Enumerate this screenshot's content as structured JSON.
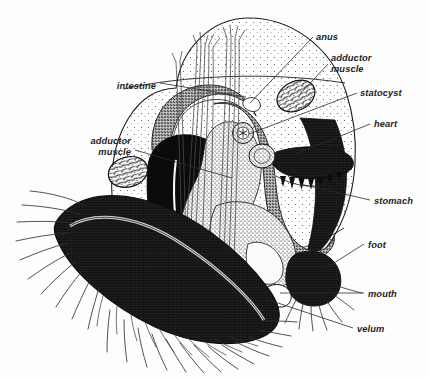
{
  "figure": {
    "organism": "veliger larva",
    "style": "black-and-white stippled scientific line drawing",
    "canvas": {
      "width": 428,
      "height": 377,
      "background": "#fdfdfd"
    },
    "ink_color": "#1d1d1d",
    "label_color": "#242424"
  },
  "labels": [
    {
      "id": "anus",
      "text": "anus",
      "side": "right",
      "x": 318,
      "y": 40,
      "anchor_x": 248,
      "anchor_y": 104
    },
    {
      "id": "adductor-right",
      "text": "adductor",
      "side": "right",
      "x": 333,
      "y": 60,
      "anchor_x": 299,
      "anchor_y": 93
    },
    {
      "id": "adductor-right-2",
      "text": "muscle",
      "side": "right",
      "x": 333,
      "y": 70,
      "anchor_x": 0,
      "anchor_y": 0
    },
    {
      "id": "statocyst",
      "text": "statocyst",
      "side": "right",
      "x": 362,
      "y": 96,
      "anchor_x": 245,
      "anchor_y": 133
    },
    {
      "id": "heart",
      "text": "heart",
      "side": "right",
      "x": 375,
      "y": 127,
      "anchor_x": 280,
      "anchor_y": 155
    },
    {
      "id": "stomach",
      "text": "stomach",
      "side": "right",
      "x": 375,
      "y": 203,
      "anchor_x": 300,
      "anchor_y": 186
    },
    {
      "id": "foot",
      "text": "foot",
      "side": "right",
      "x": 369,
      "y": 247,
      "anchor_x": 316,
      "anchor_y": 272
    },
    {
      "id": "mouth",
      "text": "mouth",
      "side": "right",
      "x": 369,
      "y": 296,
      "anchor_x": 277,
      "anchor_y": 296
    },
    {
      "id": "velum",
      "text": "velum",
      "side": "right",
      "x": 358,
      "y": 331,
      "anchor_x": 268,
      "anchor_y": 300
    },
    {
      "id": "intestine",
      "text": "intestine",
      "side": "left",
      "x": 113,
      "y": 86,
      "anchor_x": 190,
      "anchor_y": 93
    },
    {
      "id": "adductor-left",
      "text": "adductor",
      "side": "left",
      "x": 90,
      "y": 141,
      "anchor_x": 128,
      "anchor_y": 172
    },
    {
      "id": "adductor-left-2",
      "text": "muscle",
      "side": "left",
      "x": 90,
      "y": 152,
      "anchor_x": 0,
      "anchor_y": 0
    }
  ],
  "structures": [
    {
      "id": "shell",
      "name": "shell",
      "fill": "stipple-light"
    },
    {
      "id": "velum-band",
      "name": "velum",
      "fill": "stipple-dark"
    },
    {
      "id": "velar-cilia",
      "name": "velar cilia",
      "fill": "line"
    },
    {
      "id": "digestive-gland",
      "name": "digestive gland",
      "fill": "solid-black"
    },
    {
      "id": "intestine-tube",
      "name": "intestine",
      "fill": "stipple-medium"
    },
    {
      "id": "adductor-muscle-l",
      "name": "left adductor muscle",
      "fill": "mottled"
    },
    {
      "id": "adductor-muscle-r",
      "name": "right adductor muscle",
      "fill": "mottled"
    },
    {
      "id": "statocyst-body",
      "name": "statocyst",
      "fill": "stipple-medium"
    },
    {
      "id": "heart-body",
      "name": "heart",
      "fill": "stipple-medium"
    },
    {
      "id": "stomach-body",
      "name": "stomach with gastric teeth",
      "fill": "stipple-dark"
    },
    {
      "id": "foot-lobe",
      "name": "foot",
      "fill": "stipple-dark"
    },
    {
      "id": "mouth-opening",
      "name": "mouth",
      "fill": "outline"
    },
    {
      "id": "retractor-fibers",
      "name": "retractor muscle fibers",
      "fill": "line"
    },
    {
      "id": "anus-opening",
      "name": "anus",
      "fill": "outline"
    }
  ]
}
